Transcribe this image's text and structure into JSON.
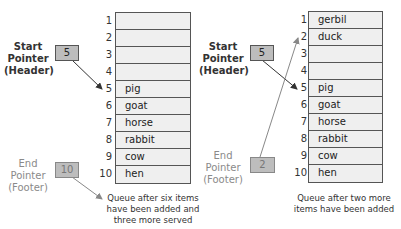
{
  "diagrams": [
    {
      "start_pointer": {
        "label_lines": [
          "Start",
          "Pointer",
          "(Header)"
        ],
        "value": "5"
      },
      "end_pointer": {
        "label_lines": [
          "End",
          "Pointer",
          "(Footer)"
        ],
        "value": "10"
      },
      "indices": [
        "1",
        "2",
        "3",
        "4",
        "5",
        "6",
        "7",
        "8",
        "9",
        "10"
      ],
      "rows": [
        "",
        "",
        "",
        "",
        "pig",
        "goat",
        "horse",
        "rabbit",
        "cow",
        "hen"
      ],
      "caption_lines": [
        "Queue after six items",
        "have been added and",
        "three more served"
      ]
    },
    {
      "start_pointer": {
        "label_lines": [
          "Start",
          "Pointer",
          "(Header)"
        ],
        "value": "5"
      },
      "end_pointer": {
        "label_lines": [
          "End",
          "Pointer",
          "(Footer)"
        ],
        "value": "2"
      },
      "indices": [
        "1",
        "2",
        "3",
        "4",
        "5",
        "6",
        "7",
        "8",
        "9",
        "10"
      ],
      "rows": [
        "gerbil",
        "duck",
        "",
        "",
        "pig",
        "goat",
        "horse",
        "rabbit",
        "cow",
        "hen"
      ],
      "caption_lines": [
        "Queue after two more",
        "items have been added"
      ]
    }
  ],
  "colors": {
    "pointer_box": "#bdbdbd",
    "cell": "#efefef",
    "border": "#555555",
    "end_label": "#8a8a8a"
  }
}
